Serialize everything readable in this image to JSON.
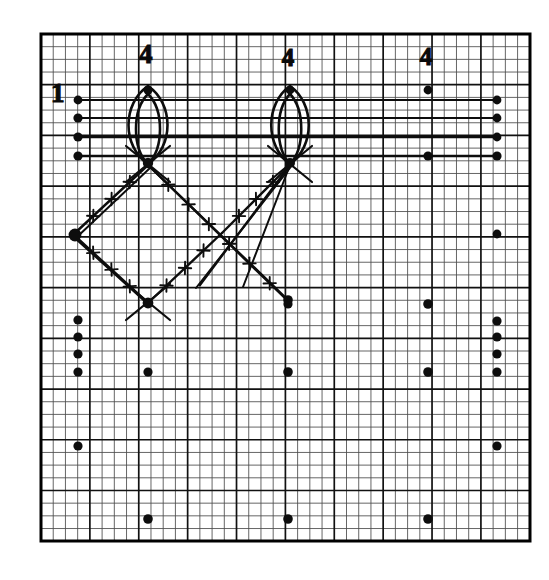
{
  "figure": {
    "kind": "hand-drawn-geometric-diagram-on-graph-paper",
    "background_color": "#ffffff",
    "ink_color": "#0d0d0d",
    "width": 549,
    "height": 580
  },
  "grid": {
    "left": 41,
    "top": 34,
    "right": 530,
    "bottom": 541,
    "minor_step_x": 12.22,
    "minor_step_y": 12.68,
    "minor_cols": 40,
    "minor_rows": 40,
    "major_every": 4,
    "minor_color": "#4a4a4a",
    "major_color": "#111111",
    "border_color": "#000000",
    "minor_width": 0.85,
    "major_width": 1.7,
    "border_width": 3.0
  },
  "labels": [
    {
      "name": "label-1-left",
      "text": "1",
      "x": 60,
      "y": 101,
      "size": 27
    },
    {
      "name": "label-4-first",
      "text": "4",
      "x": 148,
      "y": 62,
      "size": 27
    },
    {
      "name": "label-4-second",
      "text": "4",
      "x": 290,
      "y": 64,
      "size": 25
    },
    {
      "name": "label-4-third",
      "text": "4",
      "x": 428,
      "y": 63,
      "size": 25
    }
  ],
  "lenses": [
    {
      "name": "lens-outer-left",
      "cx": 148,
      "top": 86,
      "bottom": 164,
      "half_width": 26,
      "stroke": 2.6
    },
    {
      "name": "lens-inner-left",
      "cx": 148,
      "top": 94,
      "bottom": 164,
      "half_width": 16,
      "stroke": 2.6
    },
    {
      "name": "lens-outer-right",
      "cx": 290,
      "top": 86,
      "bottom": 164,
      "half_width": 25,
      "stroke": 2.6
    },
    {
      "name": "lens-inner-right",
      "cx": 290,
      "top": 94,
      "bottom": 164,
      "half_width": 15,
      "stroke": 2.6
    }
  ],
  "horizontal_lines": [
    {
      "name": "hline-1",
      "x1": 78,
      "x2": 497,
      "y": 100,
      "stroke": 2.0
    },
    {
      "name": "hline-2",
      "x1": 78,
      "x2": 497,
      "y": 118,
      "stroke": 2.0
    },
    {
      "name": "hline-3",
      "x1": 78,
      "x2": 497,
      "y": 137,
      "stroke": 2.3
    },
    {
      "name": "hline-4",
      "x1": 78,
      "x2": 497,
      "y": 156,
      "stroke": 2.3
    }
  ],
  "tick_lines": [
    {
      "name": "diag-upper-left-edge",
      "x1": 75,
      "y1": 233,
      "x2": 148,
      "y2": 165,
      "ticks": 3,
      "stroke": 2.4
    },
    {
      "name": "diag-upper-left-edge-b",
      "x1": 77,
      "y1": 237,
      "x2": 150,
      "y2": 168,
      "ticks": 0,
      "stroke": 2.0
    },
    {
      "name": "diag-lower-left-edge",
      "x1": 75,
      "y1": 236,
      "x2": 148,
      "y2": 303,
      "ticks": 3,
      "stroke": 2.4
    },
    {
      "name": "diag-lower-left-edge-b",
      "x1": 77,
      "y1": 240,
      "x2": 150,
      "y2": 306,
      "ticks": 0,
      "stroke": 2.0
    },
    {
      "name": "diag-upper-right-edge",
      "x1": 148,
      "y1": 303,
      "x2": 222,
      "y2": 233,
      "ticks": 3,
      "stroke": 2.4
    },
    {
      "name": "diag-lens1-to-lower-right",
      "x1": 148,
      "y1": 165,
      "x2": 290,
      "y2": 303,
      "ticks": 6,
      "stroke": 2.4
    },
    {
      "name": "diag-lens2-to-lower-right",
      "x1": 290,
      "y1": 165,
      "x2": 222,
      "y2": 233,
      "ticks": 3,
      "stroke": 2.4
    },
    {
      "name": "diag-lens2-long-down",
      "x1": 290,
      "y1": 165,
      "x2": 243,
      "y2": 287,
      "ticks": 0,
      "stroke": 2.0
    }
  ],
  "plain_lines": [
    {
      "name": "cross-left-top-a",
      "x1": 126,
      "y1": 182,
      "x2": 170,
      "y2": 146,
      "stroke": 2.2
    },
    {
      "name": "cross-left-top-b",
      "x1": 126,
      "y1": 146,
      "x2": 170,
      "y2": 182,
      "stroke": 2.2
    },
    {
      "name": "cross-right-top-a",
      "x1": 268,
      "y1": 182,
      "x2": 312,
      "y2": 146,
      "stroke": 2.2
    },
    {
      "name": "cross-right-top-b",
      "x1": 268,
      "y1": 146,
      "x2": 312,
      "y2": 182,
      "stroke": 2.2
    },
    {
      "name": "cross-left-bottom-a",
      "x1": 126,
      "y1": 284,
      "x2": 170,
      "y2": 320,
      "stroke": 2.2
    },
    {
      "name": "cross-left-bottom-b",
      "x1": 126,
      "y1": 320,
      "x2": 170,
      "y2": 284,
      "stroke": 2.2
    },
    {
      "name": "ray-lens1-to-dot",
      "x1": 148,
      "y1": 165,
      "x2": 288,
      "y2": 300,
      "stroke": 2.3
    },
    {
      "name": "ray-lens2-to-tail",
      "x1": 290,
      "y1": 165,
      "x2": 200,
      "y2": 285,
      "stroke": 2.3
    },
    {
      "name": "ray-lens2-tail-b",
      "x1": 290,
      "y1": 168,
      "x2": 196,
      "y2": 288,
      "stroke": 1.9
    }
  ],
  "dots": [
    {
      "name": "dot-lens1-top",
      "x": 148,
      "y": 90,
      "r": 4.6
    },
    {
      "name": "dot-lens1-bottom",
      "x": 148,
      "y": 163,
      "r": 5.2
    },
    {
      "name": "dot-lens2-top",
      "x": 290,
      "y": 90,
      "r": 4.4
    },
    {
      "name": "dot-lens2-bottom",
      "x": 290,
      "y": 163,
      "r": 5.0
    },
    {
      "name": "dot-label4-third",
      "x": 428,
      "y": 90,
      "r": 4.4
    },
    {
      "name": "dot-left-h1",
      "x": 78,
      "y": 100,
      "r": 4.4
    },
    {
      "name": "dot-left-h2",
      "x": 78,
      "y": 118,
      "r": 4.6
    },
    {
      "name": "dot-left-h3",
      "x": 78,
      "y": 137,
      "r": 4.6
    },
    {
      "name": "dot-left-h4",
      "x": 78,
      "y": 156,
      "r": 4.6
    },
    {
      "name": "dot-right-h1",
      "x": 497,
      "y": 100,
      "r": 4.4
    },
    {
      "name": "dot-right-h2",
      "x": 497,
      "y": 118,
      "r": 4.4
    },
    {
      "name": "dot-right-h3",
      "x": 497,
      "y": 137,
      "r": 4.4
    },
    {
      "name": "dot-right-h4",
      "x": 497,
      "y": 156,
      "r": 4.6
    },
    {
      "name": "dot-mid-h4",
      "x": 428,
      "y": 156,
      "r": 4.6
    },
    {
      "name": "dot-diamond-left",
      "x": 75,
      "y": 235,
      "r": 6.4
    },
    {
      "name": "dot-diamond-bottom",
      "x": 148,
      "y": 303,
      "r": 5.4
    },
    {
      "name": "dot-ray-end",
      "x": 288,
      "y": 300,
      "r": 4.8
    },
    {
      "name": "dot-right-mid",
      "x": 497,
      "y": 234,
      "r": 4.4
    },
    {
      "name": "dot-left-col-1",
      "x": 78,
      "y": 320,
      "r": 4.6
    },
    {
      "name": "dot-left-col-2",
      "x": 78,
      "y": 337,
      "r": 4.6
    },
    {
      "name": "dot-left-col-3",
      "x": 78,
      "y": 354,
      "r": 4.6
    },
    {
      "name": "dot-left-col-4",
      "x": 78,
      "y": 372,
      "r": 4.6
    },
    {
      "name": "dot-left-col-5",
      "x": 78,
      "y": 446,
      "r": 4.6
    },
    {
      "name": "dot-right-col-1",
      "x": 497,
      "y": 321,
      "r": 4.6
    },
    {
      "name": "dot-right-col-2",
      "x": 497,
      "y": 337,
      "r": 4.6
    },
    {
      "name": "dot-right-col-3",
      "x": 497,
      "y": 354,
      "r": 4.6
    },
    {
      "name": "dot-right-col-4",
      "x": 497,
      "y": 372,
      "r": 4.6
    },
    {
      "name": "dot-right-col-5",
      "x": 497,
      "y": 446,
      "r": 4.6
    },
    {
      "name": "dot-row-mid-left",
      "x": 148,
      "y": 372,
      "r": 4.6
    },
    {
      "name": "dot-row-mid-c",
      "x": 288,
      "y": 372,
      "r": 4.8
    },
    {
      "name": "dot-row-mid-r",
      "x": 428,
      "y": 372,
      "r": 4.8
    },
    {
      "name": "dot-upper-c",
      "x": 288,
      "y": 304,
      "r": 4.6
    },
    {
      "name": "dot-upper-r",
      "x": 428,
      "y": 304,
      "r": 4.8
    },
    {
      "name": "dot-bottom-left",
      "x": 148,
      "y": 519,
      "r": 4.8
    },
    {
      "name": "dot-bottom-c",
      "x": 288,
      "y": 519,
      "r": 4.8
    },
    {
      "name": "dot-bottom-r",
      "x": 428,
      "y": 519,
      "r": 4.8
    }
  ]
}
